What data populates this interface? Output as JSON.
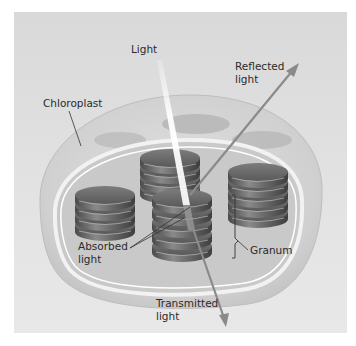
{
  "diagram": {
    "labels": {
      "light": "Light",
      "reflected": [
        "Reflected",
        "light"
      ],
      "chloroplast": "Chloroplast",
      "absorbed": [
        "Absorbed",
        "light"
      ],
      "granum": "Granum",
      "transmitted": [
        "Transmitted",
        "light"
      ]
    },
    "colors": {
      "background_panel": "#dedede",
      "arrow": "#8a8a8a",
      "light_beam": "#f5f5f5",
      "granum_dark": "#5a5a5a",
      "granum_light": "#9a9a9a",
      "text": "#2b2b2b"
    }
  }
}
